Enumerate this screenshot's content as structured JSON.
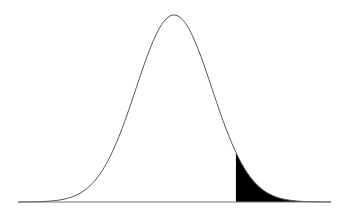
{
  "chart_data": {
    "type": "area",
    "title": "",
    "xlabel": "",
    "ylabel": "",
    "distribution": "normal",
    "mean_z": 0,
    "sd": 1,
    "shaded_region": {
      "from_z": 1.63,
      "to_z": "inf",
      "side": "right"
    },
    "x_range_z": [
      -4.1,
      4.1
    ],
    "grid": false,
    "legend": "none",
    "colors": {
      "curve": "#555555",
      "shade": "#000000",
      "baseline": "#777777",
      "background": "#ffffff"
    }
  },
  "layout": {
    "mean_px": 174,
    "sigma_px": 38,
    "baseline_y": 202,
    "peak_y": 15,
    "x_start": 18,
    "x_end": 331
  }
}
